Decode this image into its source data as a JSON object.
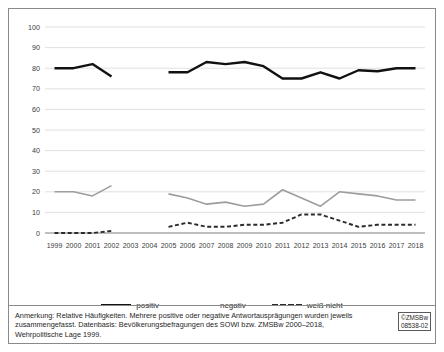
{
  "figure": {
    "note": "Anmerkung: Relative Häufigkeiten. Mehrere positive oder negative Antwortausprägungen wurden jeweils zusammengefasst. Datenbasis: Bevölkerungsbefragungen des SOWI bzw. ZMSBw 2000–2018, Wehrpolitische Lage 1999.",
    "copyright_line1": "©ZMSBw",
    "copyright_line2": "08538-02"
  },
  "colors": {
    "positiv": "#111111",
    "negativ": "#9d9d9d",
    "weiss_nicht": "#2b2b2b",
    "grid": "#d4d4d4",
    "frame": "#8a8a8a",
    "text": "#3b3b3b"
  },
  "legend": {
    "items": [
      {
        "label": "positiv",
        "key": "positiv"
      },
      {
        "label": "negativ",
        "key": "negativ"
      },
      {
        "label": "weiß nicht",
        "key": "weiss_nicht"
      }
    ]
  },
  "chart_data": {
    "type": "line",
    "title": "",
    "xlabel": "",
    "ylabel": "",
    "ylim": [
      0,
      100
    ],
    "ytick_step": 10,
    "yticks": [
      0,
      10,
      20,
      30,
      40,
      50,
      60,
      70,
      80,
      90,
      100
    ],
    "grid": true,
    "legend_position": "bottom",
    "categories": [
      "1999",
      "2000",
      "2001",
      "2002",
      "2003",
      "2004",
      "2005",
      "2006",
      "2007",
      "2008",
      "2009",
      "2010",
      "2011",
      "2012",
      "2013",
      "2014",
      "2015",
      "2016",
      "2017",
      "2018"
    ],
    "series": [
      {
        "name": "positiv",
        "color": "#111111",
        "style": "solid",
        "values": [
          80,
          80,
          82,
          76,
          null,
          null,
          78,
          78,
          83,
          82,
          83,
          81,
          75,
          75,
          78,
          75,
          79,
          78.5,
          80,
          80
        ]
      },
      {
        "name": "negativ",
        "color": "#9d9d9d",
        "style": "solid",
        "values": [
          20,
          20,
          18,
          23,
          null,
          null,
          19,
          17,
          14,
          15,
          13,
          14,
          21,
          17,
          13,
          20,
          19,
          18,
          16,
          16
        ]
      },
      {
        "name": "weiß nicht",
        "color": "#2b2b2b",
        "style": "dashed",
        "values": [
          0,
          0,
          0,
          1,
          null,
          null,
          3,
          5,
          3,
          3,
          4,
          4,
          5,
          9,
          9,
          6,
          3,
          4,
          4,
          4
        ]
      }
    ]
  }
}
